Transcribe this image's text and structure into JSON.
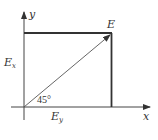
{
  "diagram": {
    "axes": {
      "x_label": "x",
      "y_label": "y"
    },
    "vector_label": "E",
    "component_vertical_label": "E",
    "component_vertical_subscript": "x",
    "component_horizontal_label": "E",
    "component_horizontal_subscript": "y",
    "angle_label": "45°",
    "colors": {
      "line": "#333333",
      "thin_line": "#555555",
      "background": "#ffffff"
    }
  }
}
